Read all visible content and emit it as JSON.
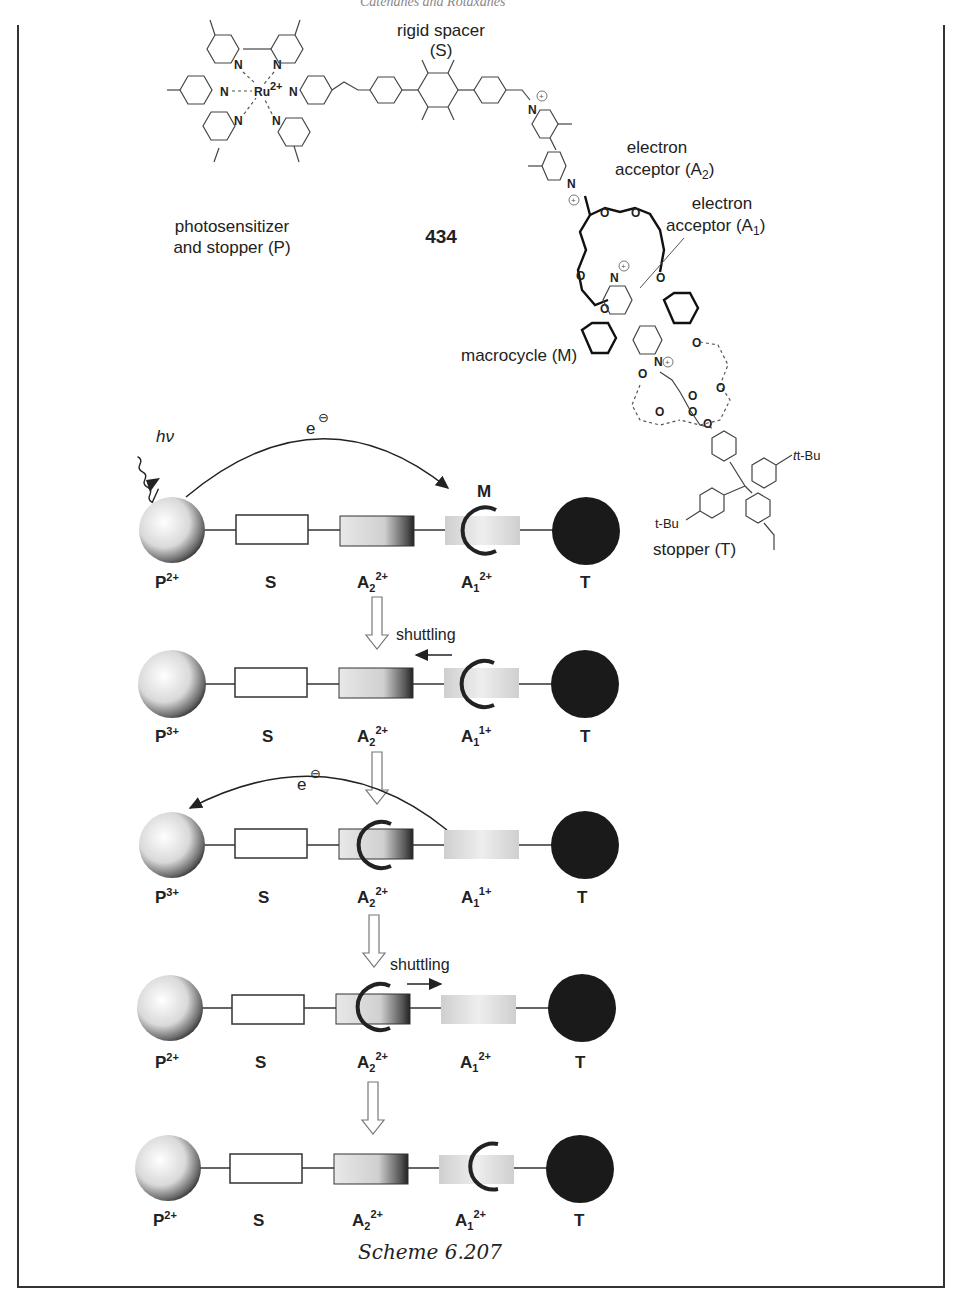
{
  "page": {
    "header_cropped": "Catenanes and Rotaxanes"
  },
  "molecule": {
    "compound_number": "434",
    "labels": {
      "spacer_line1": "rigid spacer",
      "spacer_line2": "(S)",
      "photosensitizer_line1": "photosensitizer",
      "photosensitizer_line2": "and stopper (P)",
      "acceptor2_line1": "electron",
      "acceptor2_line2": "acceptor (A",
      "acceptor2_sub": "2",
      "acceptor1_line1": "electron",
      "acceptor1_line2": "acceptor (A",
      "acceptor1_sub": "1",
      "close_paren": ")",
      "macrocycle": "macrocycle (M)",
      "stopper": "stopper (T)",
      "tbu_1": "t-Bu",
      "tbu_2": "t-Bu",
      "metal": "Ru",
      "metal_charge": "2+",
      "nitrogen": "N",
      "oxygen": "O"
    }
  },
  "scheme": {
    "caption": "Scheme 6.207",
    "hv": "hν",
    "electron": "e",
    "electron_charge": "⊖",
    "macrocycle_label": "M",
    "shuttling_label": "shuttling",
    "component_labels": [
      "P",
      "S",
      "A",
      "A",
      "T"
    ],
    "rows": [
      {
        "P": "2+",
        "A2": "2+",
        "A1": "2+",
        "ring_on": "A1",
        "arrow": "e-transfer P→A1"
      },
      {
        "P": "3+",
        "A2": "2+",
        "A1": "1+",
        "ring_on": "A1",
        "arrow": "shuttling left"
      },
      {
        "P": "3+",
        "A2": "2+",
        "A1": "1+",
        "ring_on": "A2",
        "arrow": "e-transfer A1→P"
      },
      {
        "P": "2+",
        "A2": "2+",
        "A1": "2+",
        "ring_on": "A2",
        "arrow": "shuttling right"
      },
      {
        "P": "2+",
        "A2": "2+",
        "A1": "2+",
        "ring_on": "A1",
        "arrow": "none"
      }
    ],
    "subscripts": {
      "A2": "2",
      "A1": "1"
    }
  },
  "colors": {
    "stopper_T": "#1a1a1a",
    "ring": "#222222",
    "acceptor_A1": "#d8d8d8",
    "line": "#333333"
  }
}
